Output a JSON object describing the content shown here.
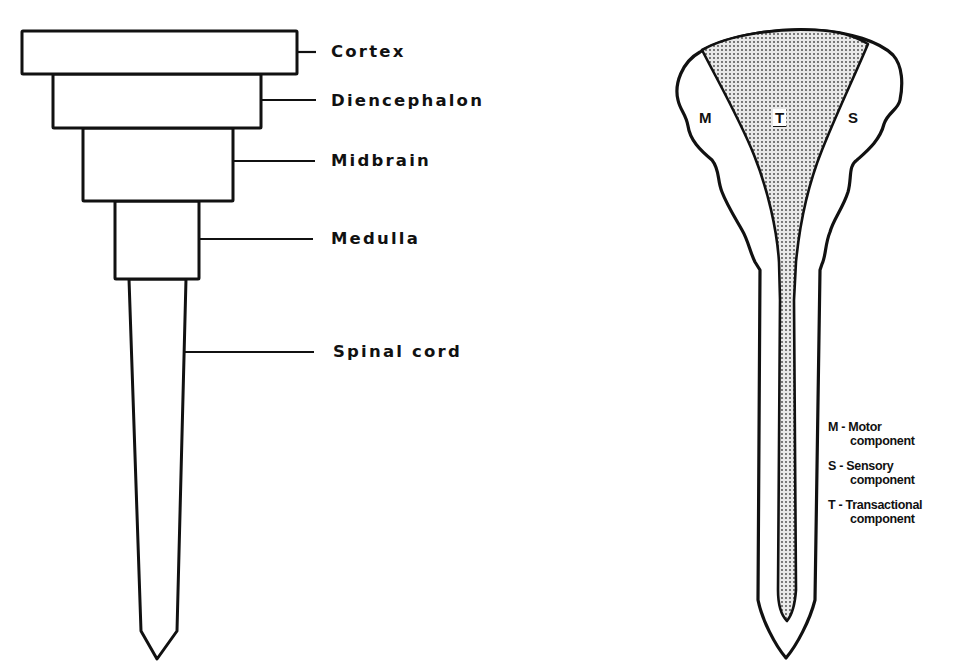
{
  "left_diagram": {
    "title": "Hierarchical levels of the nervous system",
    "levels": [
      {
        "label": "Cortex"
      },
      {
        "label": "Diencephalon"
      },
      {
        "label": "Midbrain"
      },
      {
        "label": "Medulla"
      },
      {
        "label": "Spinal cord"
      }
    ]
  },
  "right_diagram": {
    "regions": {
      "motor": "M",
      "transactional": "T",
      "sensory": "S"
    },
    "legend": [
      {
        "key": "M",
        "line1": "M - Motor",
        "line2": "component"
      },
      {
        "key": "S",
        "line1": "S - Sensory",
        "line2": "component"
      },
      {
        "key": "T",
        "line1": "T - Transactional",
        "line2": "component"
      }
    ]
  },
  "colors": {
    "stroke": "#111111",
    "background": "#ffffff",
    "stipple": "#555555"
  }
}
